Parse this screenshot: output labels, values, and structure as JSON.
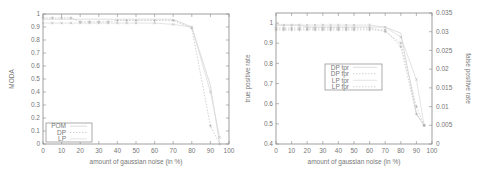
{
  "chart_data": [
    {
      "type": "line",
      "title": "",
      "xlabel": "amount of gaussian noise (in %)",
      "ylabel": "MODA",
      "xlim": [
        0,
        100
      ],
      "ylim": [
        0,
        1
      ],
      "x_ticks": [
        "0",
        "10",
        "20",
        "30",
        "40",
        "50",
        "60",
        "70",
        "80",
        "90",
        "100"
      ],
      "y_ticks": [
        "0",
        "0.1",
        "0.2",
        "0.3",
        "0.4",
        "0.5",
        "0.6",
        "0.7",
        "0.8",
        "0.9",
        "1"
      ],
      "grid": false,
      "legend_position": "lower left",
      "x": [
        0,
        5,
        10,
        15,
        20,
        25,
        30,
        35,
        40,
        45,
        50,
        60,
        70,
        80,
        90,
        95
      ],
      "series": [
        {
          "name": "POM",
          "values": [
            0.96,
            0.96,
            0.96,
            0.96,
            0.96,
            0.96,
            0.96,
            0.96,
            0.96,
            0.96,
            0.96,
            0.96,
            0.96,
            0.9,
            0.45,
            0.0
          ]
        },
        {
          "name": "DP",
          "values": [
            0.97,
            0.97,
            0.97,
            0.97,
            0.94,
            0.94,
            0.94,
            0.94,
            0.95,
            0.95,
            0.95,
            0.95,
            0.95,
            0.89,
            0.14,
            0.0
          ]
        },
        {
          "name": "LP",
          "values": [
            0.93,
            0.93,
            0.93,
            0.93,
            0.93,
            0.93,
            0.93,
            0.93,
            0.93,
            0.93,
            0.93,
            0.93,
            0.92,
            0.9,
            0.4,
            0.05
          ]
        }
      ]
    },
    {
      "type": "line",
      "title": "",
      "xlabel": "amount of gaussian noise (in %)",
      "ylabel": "true positive rate",
      "y2label": "false positive rate",
      "xlim": [
        0,
        100
      ],
      "ylim": [
        0.4,
        1.05
      ],
      "y2lim": [
        0,
        0.035
      ],
      "x_ticks": [
        "0",
        "10",
        "20",
        "30",
        "40",
        "50",
        "60",
        "70",
        "80",
        "90",
        "100"
      ],
      "y_ticks": [
        "0.4",
        "0.5",
        "0.6",
        "0.7",
        "0.8",
        "0.9",
        "1"
      ],
      "y2_ticks": [
        "0",
        "0.005",
        "0.01",
        "0.015",
        "0.02",
        "0.025",
        "0.03",
        "0.035"
      ],
      "grid": false,
      "legend_position": "center",
      "x": [
        0,
        5,
        10,
        15,
        20,
        25,
        30,
        35,
        40,
        45,
        50,
        60,
        70,
        80,
        90,
        95
      ],
      "series": [
        {
          "name": "DP tpr",
          "axis": "y",
          "values": [
            0.99,
            0.99,
            0.99,
            0.99,
            0.98,
            0.98,
            0.98,
            0.98,
            0.98,
            0.98,
            0.98,
            0.98,
            0.98,
            0.95,
            0.55,
            0.49
          ]
        },
        {
          "name": "DP fpr",
          "axis": "y2",
          "values": [
            0.0305,
            0.0305,
            0.0305,
            0.0305,
            0.0305,
            0.0305,
            0.0305,
            0.0305,
            0.0305,
            0.0305,
            0.0305,
            0.0305,
            0.0305,
            0.026,
            0.008,
            0.005
          ]
        },
        {
          "name": "LP tpr",
          "axis": "y",
          "values": [
            0.99,
            0.99,
            0.99,
            0.99,
            0.99,
            0.99,
            0.99,
            0.99,
            0.99,
            0.99,
            0.99,
            0.99,
            0.98,
            0.93,
            0.72,
            0.49
          ]
        },
        {
          "name": "LP fpr",
          "axis": "y2",
          "values": [
            0.031,
            0.031,
            0.031,
            0.031,
            0.031,
            0.031,
            0.031,
            0.031,
            0.031,
            0.031,
            0.031,
            0.031,
            0.03,
            0.027,
            0.01,
            0.005
          ]
        }
      ]
    }
  ]
}
